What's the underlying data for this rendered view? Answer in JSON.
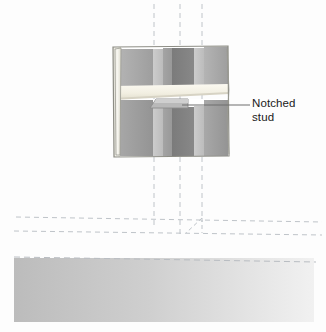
{
  "figure": {
    "kind": "technical-illustration",
    "background_color": "#fdfdfd"
  },
  "callout": {
    "line1": "Notched",
    "line2": "stud",
    "text_color": "#202020",
    "leader_color": "#6e6e6e",
    "leader": {
      "x_start": 182,
      "x_end": 250,
      "y": 105
    }
  },
  "wall_panel": {
    "name": "drywall-cutout-panel",
    "x": 112,
    "y": 46,
    "width": 116,
    "height": 111,
    "outline_color": "#8d8d85",
    "cut_edge_color": "#f2f1ea",
    "studs": [
      {
        "name": "stud-1",
        "x": 118,
        "width": 34,
        "color_top": "#a9a9a9",
        "color_bottom": "#9b9b9b"
      },
      {
        "name": "stud-2",
        "x": 152,
        "width": 10,
        "color_top": "#c6c6c6",
        "color_bottom": "#bdbdbd"
      },
      {
        "name": "stud-3-notched",
        "x": 162,
        "width": 22,
        "color_top": "#a2a2a2",
        "color_bottom": "#979797"
      },
      {
        "name": "stud-4-shadow",
        "x": 172,
        "width": 22,
        "color_top": "#7d7d7d",
        "color_bottom": "#8a8a8a"
      },
      {
        "name": "stud-5",
        "x": 194,
        "width": 10,
        "color_top": "#c2c2c2",
        "color_bottom": "#b9b9b9"
      },
      {
        "name": "stud-6",
        "x": 204,
        "width": 24,
        "color_top": "#a9a9a9",
        "color_bottom": "#9d9d9d"
      }
    ],
    "horizontal_board": {
      "name": "horizontal-plate-board",
      "color": "#f4f1e6",
      "edge_color": "#cfcabc",
      "y": 86,
      "height": 13
    },
    "notch": {
      "name": "stud-notch",
      "x": 150,
      "y": 99,
      "width": 38,
      "height": 9,
      "color": "#b7b7b7",
      "edge_color": "#8a8a8a"
    }
  },
  "guides": {
    "dash_color": "#bfc4c9",
    "vertical_lines": [
      {
        "name": "guide-vertical-left",
        "x": 154,
        "y_top": 4,
        "y_bottom": 228
      },
      {
        "name": "guide-vertical-center",
        "x": 180,
        "y_top": 4,
        "y_bottom": 236
      },
      {
        "name": "guide-vertical-right",
        "x": 202,
        "y_top": 4,
        "y_bottom": 222
      }
    ],
    "horizontal_lines": [
      {
        "name": "guide-horizontal-upper",
        "y_left": 216,
        "y_right": 222
      },
      {
        "name": "guide-horizontal-lower",
        "y_left": 230,
        "y_right": 234
      }
    ],
    "corner_detail": {
      "name": "guide-corner-miter",
      "x": 180,
      "y": 222
    }
  },
  "floor_band": {
    "name": "floor-band",
    "y": 256,
    "height": 66,
    "gradient_from": "#bdbdbd",
    "gradient_to": "#f0f0f0",
    "dashed_edge_color": "#b9bdc2"
  }
}
